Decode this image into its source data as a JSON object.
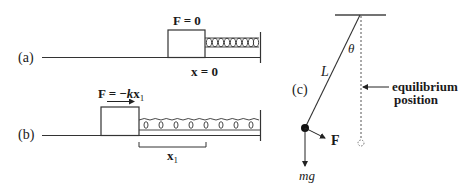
{
  "figure": {
    "panel_a": {
      "label": "(a)",
      "force_label": "F = 0",
      "position_label": "x = 0"
    },
    "panel_b": {
      "label": "(b)",
      "force_label_prefix": "F = −",
      "force_label_k": "k",
      "force_label_x": "x",
      "force_label_sub": "1",
      "displacement_label": "x",
      "displacement_sub": "1"
    },
    "panel_c": {
      "label": "(c)",
      "angle_label": "θ",
      "length_label": "L",
      "equilibrium_line1": "equilibrium",
      "equilibrium_line2": "position",
      "force_label": "F",
      "weight_label": "mg"
    }
  },
  "colors": {
    "ink": "#1a1a1a",
    "line": "#333333",
    "background": "#ffffff"
  }
}
